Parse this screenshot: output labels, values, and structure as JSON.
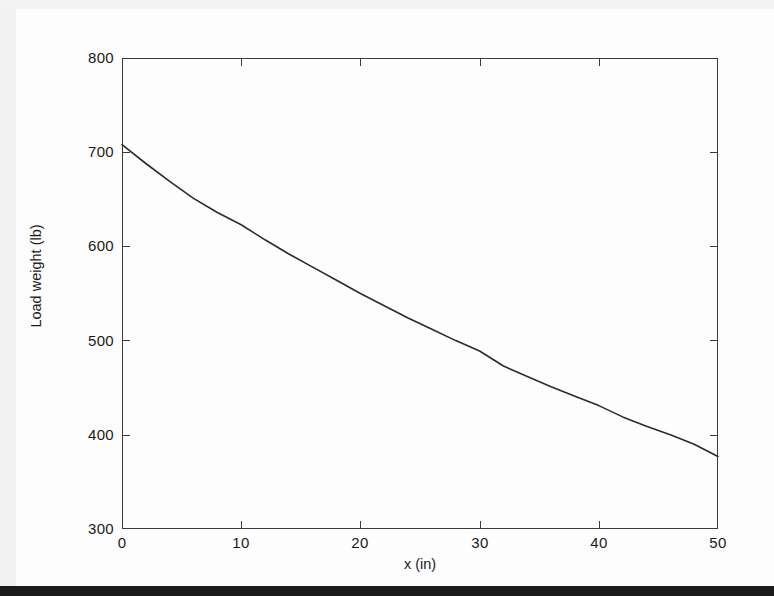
{
  "chart_data": {
    "type": "line",
    "title": "",
    "xlabel": "x (in)",
    "ylabel": "Load weight (lb)",
    "xlim": [
      0,
      50
    ],
    "ylim": [
      300,
      800
    ],
    "xticks": [
      0,
      10,
      20,
      30,
      40,
      50
    ],
    "yticks": [
      300,
      400,
      500,
      600,
      700,
      800
    ],
    "xtick_labels": [
      "0",
      "10",
      "20",
      "30",
      "40",
      "50"
    ],
    "ytick_labels": [
      "300",
      "400",
      "500",
      "600",
      "700",
      "800"
    ],
    "grid": false,
    "legend": null,
    "legend_position": "none",
    "series": [
      {
        "name": "Load weight",
        "color": "#2b2b2b",
        "line_width": 1.6,
        "x": [
          0,
          2,
          4,
          6,
          8,
          10,
          12,
          14,
          16,
          18,
          20,
          22,
          24,
          26,
          28,
          30,
          32,
          34,
          36,
          38,
          40,
          42,
          44,
          46,
          48,
          50
        ],
        "y": [
          708,
          688,
          669,
          651,
          636,
          623,
          607,
          592,
          578,
          564,
          550,
          537,
          524,
          512,
          500,
          489,
          473,
          462,
          451,
          441,
          431,
          419,
          409,
          400,
          390,
          377
        ]
      }
    ]
  },
  "axes": {
    "box_border_color": "#3a3a3a",
    "tick_direction": "in"
  }
}
